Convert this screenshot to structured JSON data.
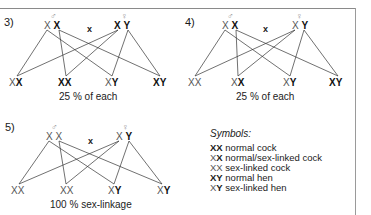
{
  "panels": [
    {
      "id": "3",
      "label": "3)",
      "male_symbol": "♂",
      "female_symbol": "♀",
      "cross_symbol": "x",
      "male_genes": [
        {
          "text": "X",
          "type": "sex-linked"
        },
        {
          "text": "X",
          "type": "normal"
        }
      ],
      "female_genes": [
        {
          "text": "X",
          "type": "normal"
        },
        {
          "text": "Y",
          "type": "normal"
        }
      ],
      "offspring": [
        {
          "g1": "X",
          "t1": "sex-linked",
          "g2": "X",
          "t2": "normal"
        },
        {
          "g1": "X",
          "t1": "normal",
          "g2": "X",
          "t2": "normal"
        },
        {
          "g1": "X",
          "t1": "sex-linked",
          "g2": "Y",
          "t2": "normal"
        },
        {
          "g1": "X",
          "t1": "normal",
          "g2": "Y",
          "t2": "normal"
        }
      ],
      "caption": "25 % of each"
    },
    {
      "id": "4",
      "label": "4)",
      "male_symbol": "♂",
      "female_symbol": "♀",
      "cross_symbol": "x",
      "male_genes": [
        {
          "text": "X",
          "type": "sex-linked"
        },
        {
          "text": "X",
          "type": "normal"
        }
      ],
      "female_genes": [
        {
          "text": "X",
          "type": "sex-linked"
        },
        {
          "text": "Y",
          "type": "normal"
        }
      ],
      "offspring": [
        {
          "g1": "X",
          "t1": "sex-linked",
          "g2": "X",
          "t2": "sex-linked"
        },
        {
          "g1": "X",
          "t1": "sex-linked",
          "g2": "X",
          "t2": "normal"
        },
        {
          "g1": "X",
          "t1": "sex-linked",
          "g2": "Y",
          "t2": "normal"
        },
        {
          "g1": "X",
          "t1": "normal",
          "g2": "Y",
          "t2": "normal"
        }
      ],
      "caption": "25 % of each"
    },
    {
      "id": "5",
      "label": "5)",
      "male_symbol": "♂",
      "female_symbol": "♀",
      "cross_symbol": "x",
      "male_genes": [
        {
          "text": "X",
          "type": "sex-linked"
        },
        {
          "text": "X",
          "type": "sex-linked"
        }
      ],
      "female_genes": [
        {
          "text": "X",
          "type": "sex-linked"
        },
        {
          "text": "Y",
          "type": "normal"
        }
      ],
      "offspring": [
        {
          "g1": "X",
          "t1": "sex-linked",
          "g2": "X",
          "t2": "sex-linked"
        },
        {
          "g1": "X",
          "t1": "sex-linked",
          "g2": "X",
          "t2": "sex-linked"
        },
        {
          "g1": "X",
          "t1": "sex-linked",
          "g2": "Y",
          "t2": "normal"
        },
        {
          "g1": "X",
          "t1": "sex-linked",
          "g2": "Y",
          "t2": "normal"
        }
      ],
      "caption": "100 % sex-linkage"
    }
  ],
  "symbols": {
    "title": "Symbols:",
    "rows": [
      {
        "g1": "X",
        "t1": "normal",
        "g2": "X",
        "t2": "normal",
        "desc": "normal cock"
      },
      {
        "g1": "X",
        "t1": "sex-linked",
        "g2": "X",
        "t2": "normal",
        "desc": "normal/sex-linked cock"
      },
      {
        "g1": "X",
        "t1": "sex-linked",
        "g2": "X",
        "t2": "sex-linked",
        "desc": "sex-linked cock"
      },
      {
        "g1": "X",
        "t1": "normal",
        "g2": "Y",
        "t2": "normal",
        "desc": "normal hen"
      },
      {
        "g1": "X",
        "t1": "sex-linked",
        "g2": "Y",
        "t2": "normal",
        "desc": "sex-linked hen"
      }
    ]
  },
  "colors": {
    "line": "#333333",
    "frame": "#8a8a8a",
    "sex_linked_gene": "#555555",
    "normal_gene": "#111111"
  }
}
